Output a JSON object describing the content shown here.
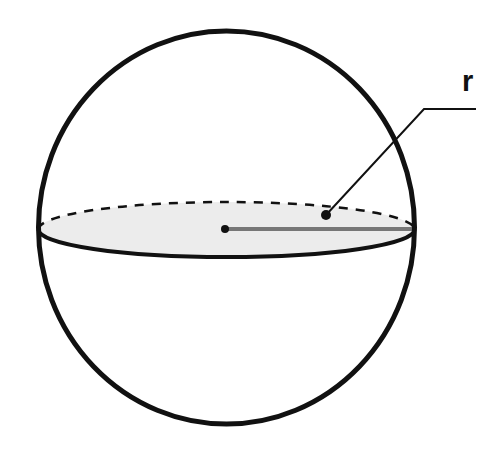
{
  "diagram": {
    "labels": {
      "radius": "r"
    },
    "colors": {
      "outline": "#111111",
      "equator_fill": "#ececec",
      "radius_line": "#777777",
      "leader_line": "#111111",
      "background": "#ffffff"
    },
    "sphere": {
      "cx": 226.5,
      "cy": 227.5,
      "rx": 188,
      "ry": 196.5,
      "stroke_width": 5
    },
    "equator": {
      "cx": 226.5,
      "cy": 229.5,
      "rx": 188,
      "ry": 27.5,
      "front_stroke_width": 4,
      "back_dash": "9,8",
      "back_stroke_width": 2.5
    },
    "center_point": {
      "x": 225,
      "y": 229,
      "r": 4
    },
    "radius_segment": {
      "x1": 225,
      "y1": 229,
      "x2": 414,
      "y2": 229,
      "stroke_width": 4
    },
    "leader": {
      "dot_x": 326,
      "dot_y": 215,
      "dot_r": 5,
      "corner_x": 424,
      "corner_y": 109,
      "end_x": 476,
      "end_y": 109
    },
    "label_position": {
      "x": 462,
      "y": 91
    }
  }
}
